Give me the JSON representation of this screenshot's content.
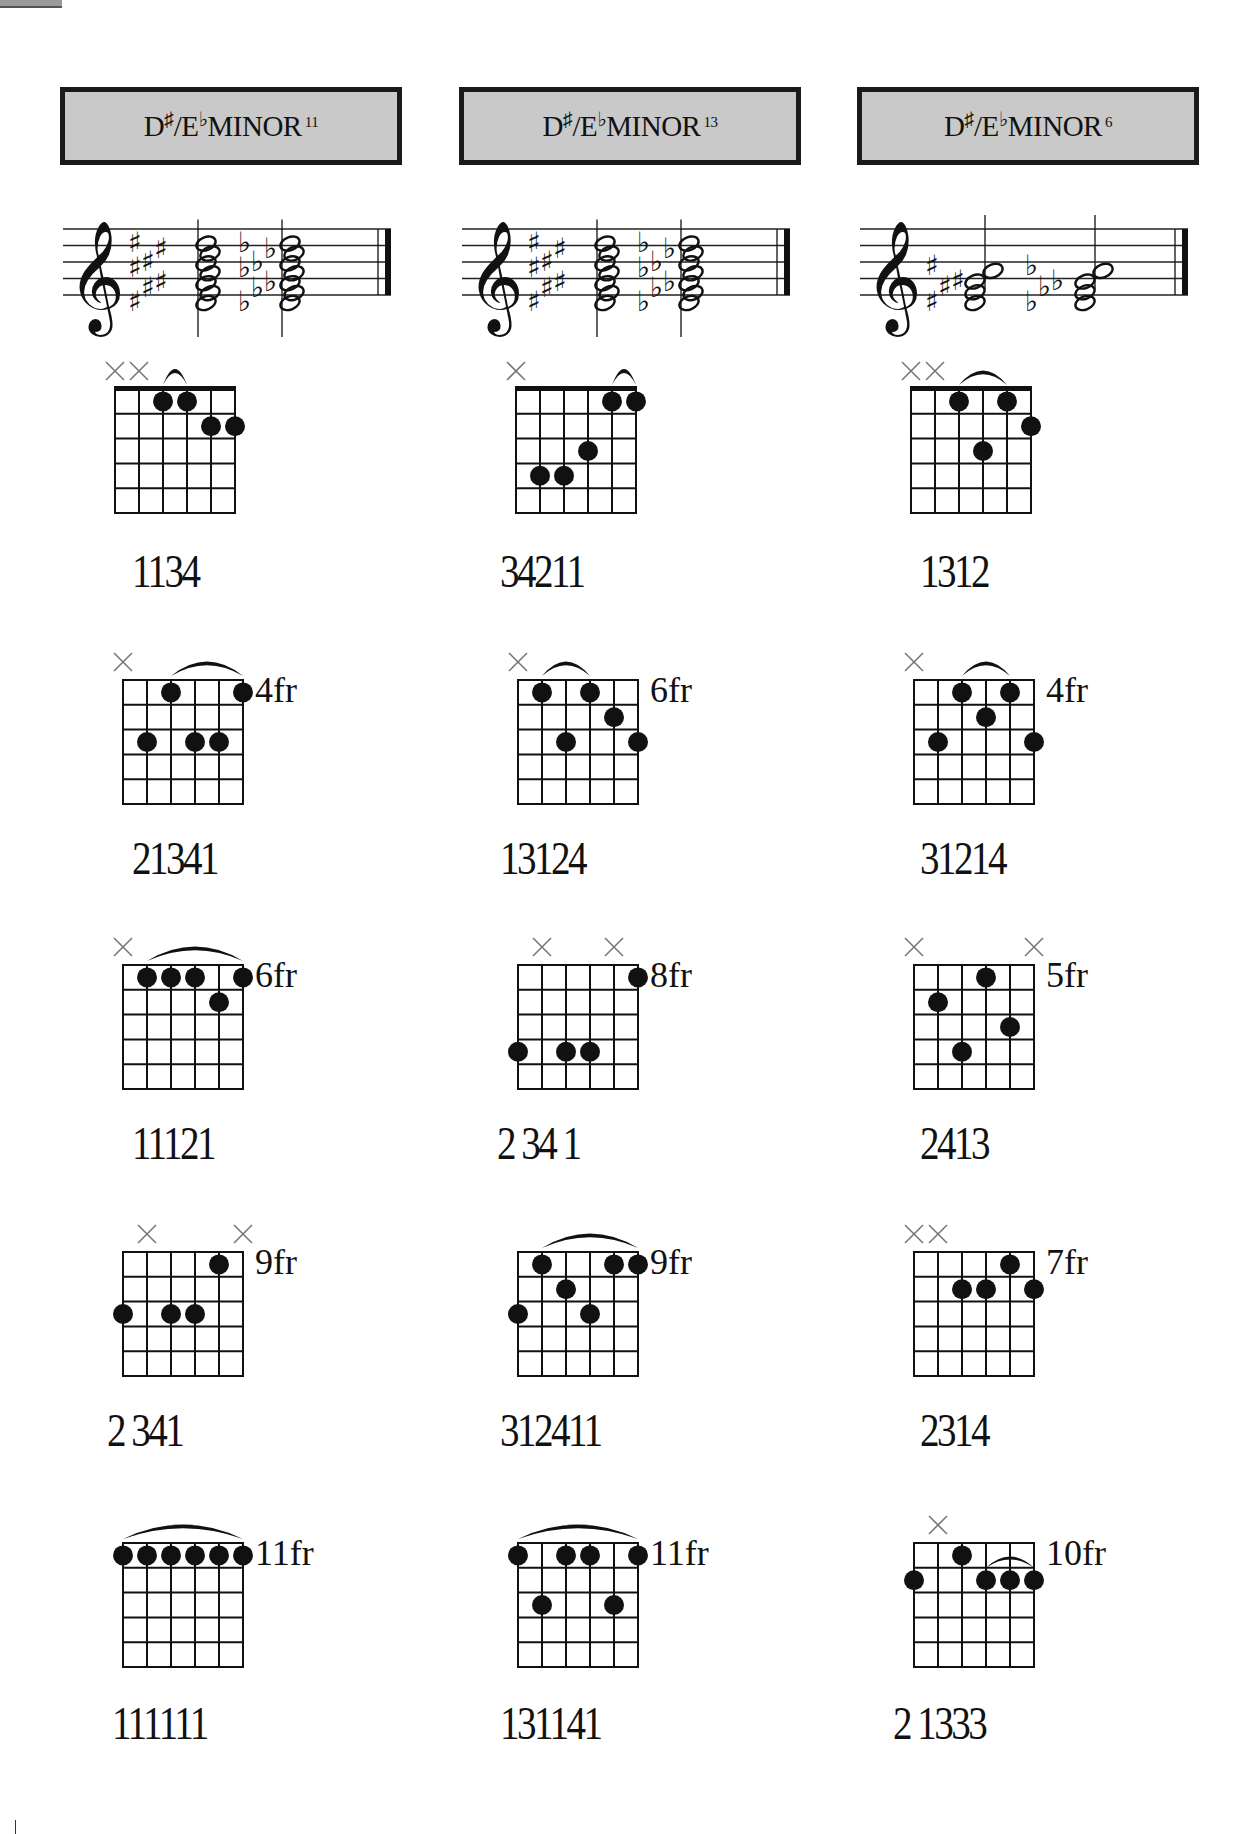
{
  "page": {
    "corner_tab": true
  },
  "columns": [
    {
      "title": {
        "root": "D",
        "sharp": "♯",
        "slash": "/E",
        "flat": "♭",
        "quality": "MINOR",
        "extension": "11"
      },
      "staff": {
        "clef": "treble",
        "chord_1_accidentals": "sharps",
        "chord_1_notes": 7,
        "chord_2_accidentals": "flats",
        "chord_2_notes": 7
      },
      "diagrams": [
        {
          "fret_label": "",
          "muted": [
            1,
            2
          ],
          "dots": [
            [
              3,
              1
            ],
            [
              4,
              1
            ],
            [
              5,
              2
            ],
            [
              6,
              2
            ]
          ],
          "barre": [
            3,
            4
          ],
          "barre_style": "tie",
          "fingering": "1134",
          "nut": true
        },
        {
          "fret_label": "4fr",
          "muted": [
            1
          ],
          "dots": [
            [
              2,
              3
            ],
            [
              3,
              1
            ],
            [
              4,
              3
            ],
            [
              5,
              3
            ],
            [
              6,
              1
            ]
          ],
          "barre": [
            3,
            6
          ],
          "barre_style": "arc",
          "fingering": "21341",
          "nut": false
        },
        {
          "fret_label": "6fr",
          "muted": [
            1
          ],
          "dots": [
            [
              2,
              1
            ],
            [
              3,
              1
            ],
            [
              4,
              1
            ],
            [
              5,
              2
            ],
            [
              6,
              1
            ]
          ],
          "barre": [
            2,
            6
          ],
          "barre_style": "arc",
          "fingering": "11121",
          "nut": false
        },
        {
          "fret_label": "9fr",
          "muted": [
            2,
            6
          ],
          "dots": [
            [
              1,
              3
            ],
            [
              3,
              3
            ],
            [
              4,
              3
            ],
            [
              5,
              1
            ]
          ],
          "barre": null,
          "fingering": "2 341",
          "nut": false
        },
        {
          "fret_label": "11fr",
          "muted": [],
          "dots": [
            [
              1,
              1
            ],
            [
              2,
              1
            ],
            [
              3,
              1
            ],
            [
              4,
              1
            ],
            [
              5,
              1
            ],
            [
              6,
              1
            ]
          ],
          "barre": [
            1,
            6
          ],
          "barre_style": "arc",
          "fingering": "111111",
          "nut": false
        }
      ]
    },
    {
      "title": {
        "root": "D",
        "sharp": "♯",
        "slash": "/E",
        "flat": "♭",
        "quality": "MINOR",
        "extension": "13"
      },
      "staff": {
        "clef": "treble",
        "chord_1_accidentals": "sharps",
        "chord_1_notes": 7,
        "chord_2_accidentals": "flats",
        "chord_2_notes": 7
      },
      "diagrams": [
        {
          "fret_label": "",
          "muted": [
            1
          ],
          "dots": [
            [
              2,
              4
            ],
            [
              3,
              4
            ],
            [
              4,
              3
            ],
            [
              5,
              1
            ],
            [
              6,
              1
            ]
          ],
          "barre": [
            5,
            6
          ],
          "barre_style": "tie",
          "fingering": "34211",
          "nut": true
        },
        {
          "fret_label": "6fr",
          "muted": [
            1
          ],
          "dots": [
            [
              2,
              1
            ],
            [
              3,
              3
            ],
            [
              4,
              1
            ],
            [
              5,
              2
            ],
            [
              6,
              3
            ]
          ],
          "barre": [
            2,
            4
          ],
          "barre_style": "arc",
          "fingering": "13124",
          "nut": false
        },
        {
          "fret_label": "8fr",
          "muted": [
            2,
            5
          ],
          "dots": [
            [
              1,
              4
            ],
            [
              3,
              4
            ],
            [
              4,
              4
            ],
            [
              6,
              1
            ]
          ],
          "barre": null,
          "fingering": "2 34 1",
          "nut": false
        },
        {
          "fret_label": "9fr",
          "muted": [],
          "dots": [
            [
              1,
              3
            ],
            [
              2,
              1
            ],
            [
              3,
              2
            ],
            [
              4,
              3
            ],
            [
              5,
              1
            ],
            [
              6,
              1
            ]
          ],
          "barre": [
            2,
            6
          ],
          "barre_style": "arc",
          "fingering": "312411",
          "nut": false
        },
        {
          "fret_label": "11fr",
          "muted": [],
          "dots": [
            [
              1,
              1
            ],
            [
              2,
              3
            ],
            [
              3,
              1
            ],
            [
              4,
              1
            ],
            [
              5,
              3
            ],
            [
              6,
              1
            ]
          ],
          "barre": [
            1,
            6
          ],
          "barre_style": "arc",
          "fingering": "131141",
          "nut": false
        }
      ]
    },
    {
      "title": {
        "root": "D",
        "sharp": "♯",
        "slash": "/E",
        "flat": "♭",
        "quality": "MINOR",
        "extension": "6"
      },
      "staff": {
        "clef": "treble",
        "chord_1_accidentals": "sharps",
        "chord_1_notes": 4,
        "chord_2_accidentals": "flats",
        "chord_2_notes": 4
      },
      "diagrams": [
        {
          "fret_label": "",
          "muted": [
            1,
            2
          ],
          "dots": [
            [
              3,
              1
            ],
            [
              4,
              3
            ],
            [
              5,
              1
            ],
            [
              6,
              2
            ]
          ],
          "barre": [
            3,
            5
          ],
          "barre_style": "arc",
          "fingering": "1312",
          "nut": true
        },
        {
          "fret_label": "4fr",
          "muted": [
            1
          ],
          "dots": [
            [
              2,
              3
            ],
            [
              3,
              1
            ],
            [
              4,
              2
            ],
            [
              5,
              1
            ],
            [
              6,
              3
            ]
          ],
          "barre": [
            3,
            5
          ],
          "barre_style": "arc",
          "fingering": "31214",
          "nut": false
        },
        {
          "fret_label": "5fr",
          "muted": [
            1,
            6
          ],
          "dots": [
            [
              2,
              2
            ],
            [
              3,
              4
            ],
            [
              4,
              1
            ],
            [
              5,
              3
            ]
          ],
          "barre": null,
          "fingering": "2413",
          "nut": false
        },
        {
          "fret_label": "7fr",
          "muted": [
            1,
            2
          ],
          "dots": [
            [
              3,
              2
            ],
            [
              4,
              2
            ],
            [
              5,
              1
            ],
            [
              6,
              2
            ]
          ],
          "barre": null,
          "fingering": "2314",
          "nut": false
        },
        {
          "fret_label": "10fr",
          "muted": [
            2
          ],
          "dots": [
            [
              1,
              2
            ],
            [
              3,
              1
            ],
            [
              4,
              2
            ],
            [
              5,
              2
            ],
            [
              6,
              2
            ]
          ],
          "barre": [
            4,
            6
          ],
          "barre_style": "tie-small",
          "fingering": "2 1333",
          "nut": false
        }
      ]
    }
  ],
  "colors": {
    "title_fill": "#c9c9c9",
    "ink": "#111111",
    "muted_x": "#777777"
  }
}
